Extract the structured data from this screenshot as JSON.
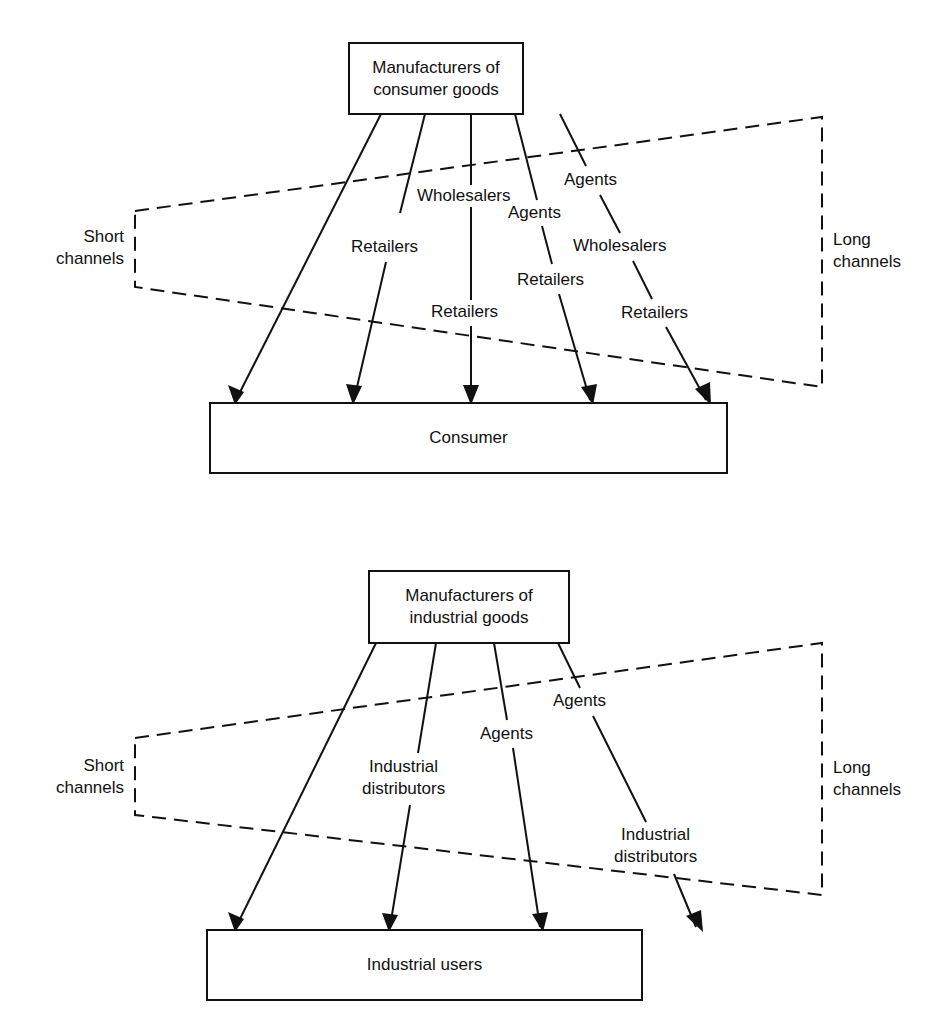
{
  "consumer_diagram": {
    "source_box": {
      "line1": "Manufacturers of",
      "line2": "consumer goods"
    },
    "target_box": "Consumer",
    "short_label": {
      "line1": "Short",
      "line2": "channels"
    },
    "long_label": {
      "line1": "Long",
      "line2": "channels"
    },
    "channels": [
      {
        "intermediaries": []
      },
      {
        "intermediaries": [
          "Retailers"
        ]
      },
      {
        "intermediaries": [
          "Wholesalers",
          "Retailers"
        ]
      },
      {
        "intermediaries": [
          "Agents",
          "Retailers"
        ]
      },
      {
        "intermediaries": [
          "Agents",
          "Wholesalers",
          "Retailers"
        ]
      }
    ],
    "labels": {
      "ch2_retailers": "Retailers",
      "ch3_wholesalers": "Wholesalers",
      "ch3_retailers": "Retailers",
      "ch4_agents": "Agents",
      "ch4_retailers": "Retailers",
      "ch5_agents": "Agents",
      "ch5_wholesalers": "Wholesalers",
      "ch5_retailers": "Retailers"
    }
  },
  "industrial_diagram": {
    "source_box": {
      "line1": "Manufacturers of",
      "line2": "industrial goods"
    },
    "target_box": "Industrial users",
    "short_label": {
      "line1": "Short",
      "line2": "channels"
    },
    "long_label": {
      "line1": "Long",
      "line2": "channels"
    },
    "channels": [
      {
        "intermediaries": []
      },
      {
        "intermediaries": [
          "Industrial distributors"
        ]
      },
      {
        "intermediaries": [
          "Agents"
        ]
      },
      {
        "intermediaries": [
          "Agents",
          "Industrial distributors"
        ]
      }
    ],
    "labels": {
      "ch2_distributors_line1": "Industrial",
      "ch2_distributors_line2": "distributors",
      "ch3_agents": "Agents",
      "ch4_agents": "Agents",
      "ch4_distributors_line1": "Industrial",
      "ch4_distributors_line2": "distributors"
    }
  },
  "colors": {
    "line": "#111111",
    "background": "#ffffff"
  }
}
